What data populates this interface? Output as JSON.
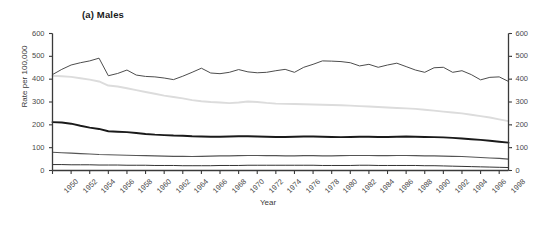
{
  "figure": {
    "panel_title": "(a) Males",
    "xlabel": "Year",
    "ylabel": "Rate per 100,000"
  },
  "axes": {
    "y_ticks": [
      "0",
      "100",
      "200",
      "300",
      "400",
      "500",
      "600"
    ],
    "y_ticks_right": [
      "0",
      "100",
      "200",
      "300",
      "400",
      "500",
      "600"
    ],
    "x_ticks": [
      "1950",
      "1952",
      "1954",
      "1956",
      "1958",
      "1960",
      "1962",
      "1964",
      "1966",
      "1968",
      "1970",
      "1972",
      "1974",
      "1976",
      "1978",
      "1980",
      "1982",
      "1984",
      "1986",
      "1988",
      "1990",
      "1992",
      "1994",
      "1996",
      "1998"
    ]
  },
  "colors": {
    "series_1": "#4d4d4d",
    "series_2": "#dcdcdc",
    "series_3": "#1a1a1a",
    "series_4": "#555555",
    "series_5": "#333333",
    "axis": "#3a3a3a",
    "background": "#ffffff"
  },
  "chart_data": {
    "type": "line",
    "title": "(a) Males",
    "xlabel": "Year",
    "ylabel": "Rate per 100,000",
    "xlim": [
      1950,
      1999
    ],
    "ylim": [
      0,
      600
    ],
    "grid": false,
    "legend": "none",
    "x": [
      1950,
      1951,
      1952,
      1953,
      1954,
      1955,
      1956,
      1957,
      1958,
      1959,
      1960,
      1961,
      1962,
      1963,
      1964,
      1965,
      1966,
      1967,
      1968,
      1969,
      1970,
      1971,
      1972,
      1973,
      1974,
      1975,
      1976,
      1977,
      1978,
      1979,
      1980,
      1981,
      1982,
      1983,
      1984,
      1985,
      1986,
      1987,
      1988,
      1989,
      1990,
      1991,
      1992,
      1993,
      1994,
      1995,
      1996,
      1997,
      1998,
      1999
    ],
    "series": [
      {
        "name": "series_1",
        "color": "#4d4d4d",
        "values": [
          420,
          443,
          462,
          472,
          480,
          492,
          415,
          425,
          440,
          418,
          412,
          410,
          405,
          398,
          413,
          430,
          448,
          427,
          424,
          430,
          442,
          432,
          428,
          430,
          437,
          443,
          430,
          452,
          465,
          480,
          479,
          477,
          472,
          458,
          465,
          452,
          462,
          470,
          455,
          440,
          430,
          450,
          452,
          430,
          437,
          420,
          397,
          408,
          410,
          390
        ]
      },
      {
        "name": "series_2",
        "color": "#dcdcdc",
        "values": [
          415,
          413,
          410,
          404,
          398,
          390,
          372,
          368,
          360,
          352,
          344,
          336,
          328,
          322,
          316,
          308,
          303,
          300,
          298,
          295,
          298,
          302,
          300,
          296,
          293,
          292,
          291,
          290,
          289,
          288,
          287,
          286,
          284,
          282,
          280,
          278,
          276,
          274,
          272,
          270,
          266,
          262,
          258,
          254,
          250,
          244,
          238,
          232,
          224,
          216
        ]
      },
      {
        "name": "series_3",
        "color": "#1a1a1a",
        "values": [
          212,
          210,
          205,
          196,
          188,
          182,
          172,
          170,
          168,
          164,
          160,
          157,
          155,
          153,
          152,
          150,
          149,
          148,
          148,
          149,
          150,
          150,
          149,
          148,
          147,
          147,
          148,
          149,
          149,
          148,
          147,
          146,
          147,
          148,
          148,
          147,
          147,
          148,
          149,
          148,
          147,
          146,
          145,
          143,
          140,
          137,
          134,
          130,
          126,
          122
        ]
      },
      {
        "name": "series_4",
        "color": "#555555",
        "values": [
          80,
          78,
          76,
          74,
          72,
          70,
          69,
          68,
          67,
          66,
          65,
          64,
          63,
          62,
          62,
          61,
          62,
          63,
          64,
          64,
          65,
          66,
          66,
          65,
          65,
          64,
          64,
          65,
          65,
          64,
          64,
          65,
          66,
          66,
          66,
          65,
          65,
          66,
          66,
          65,
          64,
          64,
          63,
          62,
          61,
          59,
          57,
          55,
          53,
          50
        ]
      },
      {
        "name": "series_5",
        "color": "#333333",
        "values": [
          26,
          26,
          25,
          25,
          25,
          24,
          24,
          24,
          23,
          23,
          23,
          22,
          22,
          22,
          21,
          21,
          21,
          21,
          22,
          22,
          22,
          23,
          23,
          23,
          23,
          23,
          23,
          23,
          23,
          22,
          22,
          22,
          22,
          23,
          23,
          22,
          22,
          22,
          22,
          22,
          21,
          21,
          20,
          19,
          18,
          17,
          16,
          15,
          14,
          13
        ]
      }
    ]
  }
}
